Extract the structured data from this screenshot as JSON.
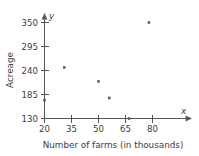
{
  "chart_data": {
    "type": "scatter",
    "title": "",
    "xlabel": "Number of farms (in thousands)",
    "ylabel": "Acreage",
    "x_axis_name": "x",
    "y_axis_name": "y",
    "xlim": [
      20,
      85
    ],
    "ylim": [
      130,
      360
    ],
    "xticks": [
      20,
      35,
      50,
      65,
      80
    ],
    "yticks": [
      130,
      185,
      240,
      295,
      350
    ],
    "xtick_labels": [
      "20",
      "35",
      "50",
      "65",
      "80"
    ],
    "ytick_labels": [
      "130",
      "185",
      "240",
      "295",
      "350"
    ],
    "grid": false,
    "legend": null,
    "point_color": "#5e5e5e",
    "axis_color": "#555555",
    "points": [
      {
        "x": 20,
        "y": 172
      },
      {
        "x": 31,
        "y": 247
      },
      {
        "x": 50,
        "y": 215
      },
      {
        "x": 56,
        "y": 177
      },
      {
        "x": 67,
        "y": 130
      },
      {
        "x": 78,
        "y": 350
      }
    ]
  }
}
